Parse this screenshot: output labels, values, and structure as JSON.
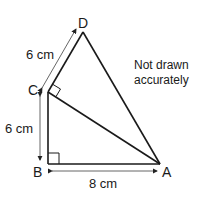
{
  "diagram": {
    "points": {
      "A": {
        "label": "A"
      },
      "B": {
        "label": "B"
      },
      "C": {
        "label": "C"
      },
      "D": {
        "label": "D"
      }
    },
    "dimensions": {
      "CD": "6 cm",
      "BC": "6 cm",
      "BA": "8 cm"
    },
    "note": {
      "line1": "Not drawn",
      "line2": "accurately"
    },
    "right_angles": [
      "B",
      "C"
    ],
    "colors": {
      "line": "#1a1a1a",
      "dimension_line": "#555555"
    }
  }
}
